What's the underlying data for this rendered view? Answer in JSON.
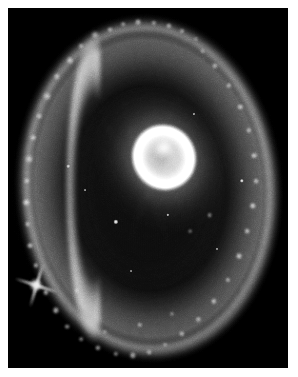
{
  "image": {
    "kind": "astronomical-photograph",
    "subject": "ring galaxy",
    "common_name": "Cartwheel Galaxy",
    "rendering": "black-and-white halftone print",
    "caption": "",
    "frame": {
      "canvas_width": 298,
      "canvas_height": 377,
      "border_color": "#ffffff",
      "border_width": 8,
      "plate_left": 8,
      "plate_top": 8,
      "plate_width": 280,
      "plate_height": 360,
      "background_color": "#090909"
    }
  },
  "palette": {
    "sky_black": "#090909",
    "faint_nebulosity": "#3a3a3a",
    "mid_gray": "#8c8c8c",
    "bright_gray": "#d2d2d2",
    "star_white": "#ffffff",
    "paper_white": "#ffffff"
  },
  "features": {
    "outer_ring": {
      "label": "outer star-forming ring",
      "center_pct": [
        50,
        50
      ],
      "radius_x_pct": 45,
      "radius_y_pct": 46,
      "rotation_deg": -4,
      "brightest_limb": "left",
      "description": "clumpy knotted ring of young star clusters"
    },
    "nucleus": {
      "label": "bright elliptical nucleus",
      "center_pct": [
        55.5,
        41.5
      ],
      "width_pct": 22,
      "height_pct": 18,
      "rotation_deg": -32,
      "description": "inner ring / bright core with dust lanes"
    },
    "foreground_star": {
      "label": "bright foreground star with diffraction spikes",
      "center_pct": [
        10,
        77
      ],
      "spike_count": 4,
      "spike_length_px": 46
    },
    "inner_void": {
      "label": "dark interior between ring and nucleus"
    },
    "spokes": {
      "label": "faint radial spokes",
      "count": 9
    }
  },
  "knots": [
    {
      "x": 31.0,
      "y": 7.5,
      "r": 3.4,
      "i": 0.95
    },
    {
      "x": 36.5,
      "y": 6.0,
      "r": 2.6,
      "i": 0.85
    },
    {
      "x": 41.0,
      "y": 4.5,
      "r": 2.2,
      "i": 0.8
    },
    {
      "x": 46.5,
      "y": 4.0,
      "r": 3.0,
      "i": 0.9
    },
    {
      "x": 52.0,
      "y": 4.2,
      "r": 2.4,
      "i": 0.82
    },
    {
      "x": 57.5,
      "y": 5.0,
      "r": 2.8,
      "i": 0.88
    },
    {
      "x": 62.0,
      "y": 6.5,
      "r": 2.3,
      "i": 0.78
    },
    {
      "x": 67.0,
      "y": 8.5,
      "r": 2.0,
      "i": 0.7
    },
    {
      "x": 26.0,
      "y": 10.5,
      "r": 2.6,
      "i": 0.84
    },
    {
      "x": 22.0,
      "y": 14.5,
      "r": 3.2,
      "i": 0.92
    },
    {
      "x": 17.5,
      "y": 19.0,
      "r": 2.8,
      "i": 0.88
    },
    {
      "x": 14.0,
      "y": 24.5,
      "r": 3.4,
      "i": 0.96
    },
    {
      "x": 11.0,
      "y": 30.0,
      "r": 2.6,
      "i": 0.86
    },
    {
      "x": 9.0,
      "y": 36.0,
      "r": 3.0,
      "i": 0.93
    },
    {
      "x": 7.5,
      "y": 42.0,
      "r": 3.4,
      "i": 0.97
    },
    {
      "x": 6.8,
      "y": 48.0,
      "r": 2.8,
      "i": 0.9
    },
    {
      "x": 6.5,
      "y": 54.0,
      "r": 3.2,
      "i": 0.95
    },
    {
      "x": 7.0,
      "y": 60.0,
      "r": 2.6,
      "i": 0.86
    },
    {
      "x": 8.0,
      "y": 66.0,
      "r": 3.0,
      "i": 0.92
    },
    {
      "x": 10.0,
      "y": 71.5,
      "r": 2.4,
      "i": 0.8
    },
    {
      "x": 13.5,
      "y": 79.0,
      "r": 2.8,
      "i": 0.86
    },
    {
      "x": 17.0,
      "y": 84.0,
      "r": 3.2,
      "i": 0.9
    },
    {
      "x": 21.0,
      "y": 88.5,
      "r": 2.6,
      "i": 0.82
    },
    {
      "x": 26.0,
      "y": 92.0,
      "r": 2.2,
      "i": 0.76
    },
    {
      "x": 32.0,
      "y": 94.5,
      "r": 2.8,
      "i": 0.84
    },
    {
      "x": 38.5,
      "y": 96.0,
      "r": 2.4,
      "i": 0.78
    },
    {
      "x": 44.5,
      "y": 96.5,
      "r": 3.2,
      "i": 0.88
    },
    {
      "x": 50.5,
      "y": 95.5,
      "r": 2.6,
      "i": 0.8
    },
    {
      "x": 56.0,
      "y": 93.5,
      "r": 2.2,
      "i": 0.72
    },
    {
      "x": 62.0,
      "y": 90.5,
      "r": 2.8,
      "i": 0.82
    },
    {
      "x": 68.0,
      "y": 86.5,
      "r": 2.4,
      "i": 0.76
    },
    {
      "x": 73.5,
      "y": 81.5,
      "r": 2.8,
      "i": 0.8
    },
    {
      "x": 78.5,
      "y": 75.5,
      "r": 2.4,
      "i": 0.74
    },
    {
      "x": 82.5,
      "y": 69.0,
      "r": 3.0,
      "i": 0.84
    },
    {
      "x": 85.5,
      "y": 62.0,
      "r": 2.6,
      "i": 0.78
    },
    {
      "x": 87.5,
      "y": 55.0,
      "r": 3.2,
      "i": 0.88
    },
    {
      "x": 88.5,
      "y": 48.0,
      "r": 2.6,
      "i": 0.8
    },
    {
      "x": 88.0,
      "y": 41.0,
      "r": 3.0,
      "i": 0.86
    },
    {
      "x": 86.0,
      "y": 34.0,
      "r": 2.4,
      "i": 0.76
    },
    {
      "x": 83.0,
      "y": 27.5,
      "r": 2.8,
      "i": 0.82
    },
    {
      "x": 79.0,
      "y": 21.5,
      "r": 2.4,
      "i": 0.74
    },
    {
      "x": 74.0,
      "y": 16.0,
      "r": 2.8,
      "i": 0.8
    },
    {
      "x": 69.5,
      "y": 12.0,
      "r": 2.2,
      "i": 0.7
    },
    {
      "x": 34.5,
      "y": 90.0,
      "r": 2.0,
      "i": 0.68
    },
    {
      "x": 47.0,
      "y": 88.0,
      "r": 2.4,
      "i": 0.74
    },
    {
      "x": 58.5,
      "y": 85.0,
      "r": 2.0,
      "i": 0.66
    },
    {
      "x": 72.0,
      "y": 57.5,
      "r": 2.2,
      "i": 0.72
    },
    {
      "x": 65.0,
      "y": 62.0,
      "r": 1.8,
      "i": 0.62
    },
    {
      "x": 24.5,
      "y": 78.5,
      "r": 2.2,
      "i": 0.74
    }
  ],
  "field_stars": [
    {
      "x": 38.5,
      "y": 59.5,
      "r": 2.2,
      "i": 1.0
    },
    {
      "x": 83.5,
      "y": 48.0,
      "r": 1.8,
      "i": 0.92
    },
    {
      "x": 57.0,
      "y": 57.5,
      "r": 1.4,
      "i": 0.78
    },
    {
      "x": 21.5,
      "y": 44.0,
      "r": 1.5,
      "i": 0.72
    },
    {
      "x": 27.5,
      "y": 50.5,
      "r": 1.2,
      "i": 0.62
    },
    {
      "x": 66.5,
      "y": 29.5,
      "r": 1.3,
      "i": 0.66
    },
    {
      "x": 44.0,
      "y": 73.0,
      "r": 1.2,
      "i": 0.6
    },
    {
      "x": 74.5,
      "y": 67.0,
      "r": 1.3,
      "i": 0.64
    }
  ],
  "spokes": [
    {
      "angle": 198,
      "length": 34,
      "width": 9,
      "opacity": 0.3
    },
    {
      "angle": 214,
      "length": 31,
      "width": 8,
      "opacity": 0.26
    },
    {
      "angle": 232,
      "length": 30,
      "width": 8,
      "opacity": 0.24
    },
    {
      "angle": 250,
      "length": 27,
      "width": 7,
      "opacity": 0.2
    },
    {
      "angle": 164,
      "length": 33,
      "width": 8,
      "opacity": 0.26
    },
    {
      "angle": 146,
      "length": 30,
      "width": 8,
      "opacity": 0.22
    },
    {
      "angle": 128,
      "length": 27,
      "width": 7,
      "opacity": 0.18
    },
    {
      "angle": 20,
      "length": 24,
      "width": 7,
      "opacity": 0.16
    },
    {
      "angle": 340,
      "length": 24,
      "width": 7,
      "opacity": 0.16
    }
  ]
}
